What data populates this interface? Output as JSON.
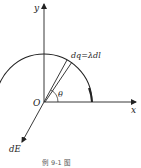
{
  "figure": {
    "labels": {
      "y_axis": "y",
      "x_axis": "x",
      "origin": "O",
      "angle": "θ",
      "charge_element": "dq=λdl",
      "field_element": "dE"
    },
    "caption": "例 9-1 图",
    "colors": {
      "stroke": "#222222",
      "background": "#ffffff"
    }
  }
}
